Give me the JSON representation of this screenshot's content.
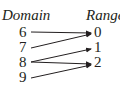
{
  "diagram": {
    "domain_label": "Domain",
    "range_label": "Range",
    "domain": [
      "6",
      "7",
      "8",
      "9"
    ],
    "range": [
      "0",
      "1",
      "2"
    ],
    "mappings": [
      {
        "from": "6",
        "to": "0"
      },
      {
        "from": "7",
        "to": "0"
      },
      {
        "from": "8",
        "to": "1"
      },
      {
        "from": "8",
        "to": "2"
      },
      {
        "from": "9",
        "to": "2"
      }
    ]
  }
}
